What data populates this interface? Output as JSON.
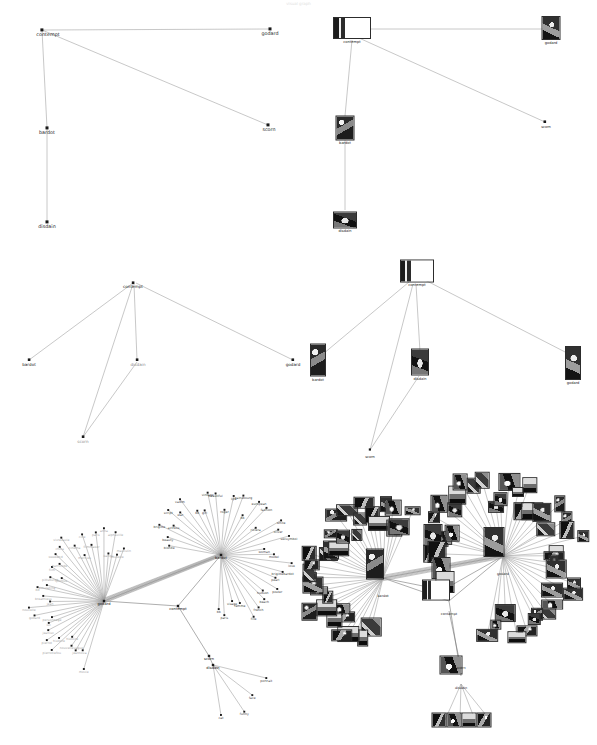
{
  "figure": {
    "title": "",
    "header_faint": "visual graph",
    "panel_count": 6,
    "layout": "2 columns x 3 rows"
  },
  "chart_data": {
    "type": "graph",
    "title": "",
    "grid": false,
    "legend": "none",
    "panels": [
      {
        "id": "panel-top-left",
        "render": "dots",
        "root": "contempt",
        "nodes": [
          {
            "id": "contempt",
            "label": "contempt",
            "x": 42,
            "y": 30
          },
          {
            "id": "godard",
            "label": "godard",
            "x": 270,
            "y": 29
          },
          {
            "id": "scorn",
            "label": "scorn",
            "x": 268,
            "y": 125
          },
          {
            "id": "bardot",
            "label": "bardot",
            "x": 47,
            "y": 128
          },
          {
            "id": "disdain",
            "label": "disdain",
            "x": 47,
            "y": 222
          }
        ],
        "edges": [
          [
            "contempt",
            "godard"
          ],
          [
            "contempt",
            "scorn"
          ],
          [
            "contempt",
            "bardot"
          ],
          [
            "bardot",
            "disdain"
          ]
        ]
      },
      {
        "id": "panel-top-right",
        "render": "thumbnails",
        "root": "contempt",
        "nodes": [
          {
            "id": "contempt",
            "label": "contempt",
            "x": 352,
            "y": 28
          },
          {
            "id": "godard",
            "label": "godard",
            "x": 551,
            "y": 29
          },
          {
            "id": "scorn",
            "label": "scorn",
            "x": 546,
            "y": 122
          },
          {
            "id": "bardot",
            "label": "bardot",
            "x": 345,
            "y": 128
          },
          {
            "id": "disdain",
            "label": "disdain",
            "x": 345,
            "y": 221
          }
        ],
        "edges": [
          [
            "contempt",
            "godard"
          ],
          [
            "contempt",
            "scorn"
          ],
          [
            "contempt",
            "bardot"
          ],
          [
            "bardot",
            "disdain"
          ]
        ]
      },
      {
        "id": "panel-middle-left",
        "render": "dots",
        "root": "contempt",
        "nodes": [
          {
            "id": "contempt",
            "label": "contempt",
            "x": 133,
            "y": 283
          },
          {
            "id": "bardot",
            "label": "bardot",
            "x": 29,
            "y": 360
          },
          {
            "id": "disdain",
            "label": "disdain",
            "x": 137,
            "y": 362
          },
          {
            "id": "godard",
            "label": "godard",
            "x": 293,
            "y": 360
          },
          {
            "id": "scorn",
            "label": "scorn",
            "x": 83,
            "y": 437
          }
        ],
        "edges": [
          [
            "contempt",
            "bardot"
          ],
          [
            "contempt",
            "disdain"
          ],
          [
            "contempt",
            "godard"
          ],
          [
            "contempt",
            "scorn"
          ],
          [
            "disdain",
            "scorn"
          ]
        ]
      },
      {
        "id": "panel-middle-right",
        "render": "thumbnails",
        "root": "contempt",
        "nodes": [
          {
            "id": "contempt",
            "label": "contempt",
            "x": 417,
            "y": 271
          },
          {
            "id": "bardot",
            "label": "bardot",
            "x": 318,
            "y": 360
          },
          {
            "id": "disdain",
            "label": "disdain",
            "x": 420,
            "y": 362
          },
          {
            "id": "godard",
            "label": "godard",
            "x": 573,
            "y": 360
          },
          {
            "id": "scorn",
            "label": "scorn",
            "x": 370,
            "y": 454
          }
        ],
        "edges": [
          [
            "contempt",
            "bardot"
          ],
          [
            "contempt",
            "disdain"
          ],
          [
            "contempt",
            "godard"
          ],
          [
            "contempt",
            "scorn"
          ],
          [
            "disdain",
            "scorn"
          ]
        ]
      },
      {
        "id": "panel-bottom-left",
        "render": "dots",
        "root": "contempt",
        "hubs": [
          "godard",
          "bardot",
          "contempt",
          "scorn",
          "disdain"
        ],
        "hub_positions": [
          {
            "id": "godard",
            "label": "godard",
            "x": 104,
            "y": 601
          },
          {
            "id": "bardot",
            "label": "bardot",
            "x": 221,
            "y": 555
          },
          {
            "id": "contempt",
            "label": "contempt",
            "x": 178,
            "y": 606
          },
          {
            "id": "scorn",
            "label": "scorn",
            "x": 209,
            "y": 656
          },
          {
            "id": "disdain",
            "label": "disdain",
            "x": 213,
            "y": 665
          }
        ],
        "edges_hub": [
          [
            "godard",
            "bardot"
          ],
          [
            "godard",
            "contempt"
          ],
          [
            "bardot",
            "contempt"
          ],
          [
            "contempt",
            "scorn"
          ],
          [
            "scorn",
            "disdain"
          ]
        ],
        "godard_leaves": [
          "movie",
          "nova",
          "jean",
          "nouvellevague",
          "histoire",
          "pierrotlefou",
          "histoire",
          "pierrot",
          "jeanluc",
          "luc",
          "personnage",
          "godard",
          "nouvelle",
          "jean",
          "breathless",
          "bd",
          "simulating",
          "pittsburgh",
          "pontus",
          "film",
          "barricode",
          "weekend",
          "china",
          "vivresavie",
          "cinema",
          "mercies",
          "cine",
          "filmmaker",
          "paris",
          "anna",
          "karina",
          "alphaville",
          "nouvelle",
          "masculin"
        ],
        "bardot_leaves": [
          "blonde",
          "beauty",
          "brigitte",
          "actress",
          "script",
          "star",
          "vadim",
          "bb",
          "girl",
          "vintage",
          "beautiful",
          "roger",
          "lips",
          "gainsbourg",
          "bb",
          "european",
          "fashion",
          "riviera",
          "white",
          "oliver",
          "sexsymbol",
          "woman",
          "model",
          "love",
          "brigittebardot",
          "pearl",
          "poster",
          "hudson",
          "beach",
          "french",
          "fille",
          "femme",
          "visage",
          "paris",
          "bb"
        ],
        "disdain_leaves": [
          "portrait",
          "face",
          "funny",
          "cat"
        ],
        "contempt_leaves": [
          "scorn",
          "disdain"
        ]
      },
      {
        "id": "panel-bottom-right",
        "render": "thumbnails",
        "root": "contempt",
        "hub_positions": [
          {
            "id": "bardot",
            "label": "bardot",
            "x": 383,
            "y": 578
          },
          {
            "id": "godard",
            "label": "godard",
            "x": 503,
            "y": 556
          },
          {
            "id": "bb",
            "label": "bb",
            "x": 443,
            "y": 590
          },
          {
            "id": "contempt",
            "label": "contempt",
            "x": 449,
            "y": 601
          },
          {
            "id": "scorn",
            "label": "scorn",
            "x": 461,
            "y": 666
          },
          {
            "id": "disdain",
            "label": "disdain",
            "x": 461,
            "y": 676
          }
        ],
        "edges_hub": [
          [
            "bardot",
            "godard"
          ],
          [
            "bardot",
            "bb"
          ],
          [
            "bb",
            "godard"
          ],
          [
            "bardot",
            "contempt"
          ],
          [
            "contempt",
            "godard"
          ],
          [
            "contempt",
            "disdain"
          ]
        ],
        "bardot_cluster_labels": [
          "bardot",
          "blonde",
          "beauty",
          "brigitte",
          "bb",
          "vintage",
          "love",
          "brigittebardot"
        ],
        "godard_cluster_labels": [
          "godard",
          "jean",
          "nouvelle",
          "vague",
          "souffle",
          "pierrot",
          "bout"
        ],
        "disdain_leaf_labels": [
          "portrait",
          "face",
          "funny",
          "scorn"
        ]
      }
    ]
  },
  "labels": {
    "contempt": "contempt",
    "godard": "godard",
    "bardot": "bardot",
    "scorn": "scorn",
    "disdain": "disdain"
  }
}
